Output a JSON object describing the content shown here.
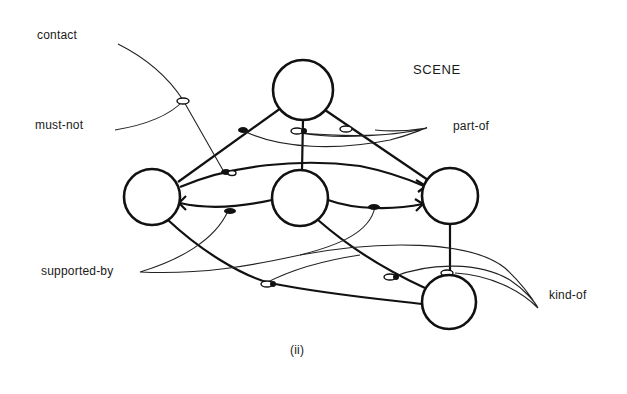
{
  "diagram": {
    "title": "SCENE",
    "caption": "(ii)",
    "relation_labels": {
      "contact": "contact",
      "must_not": "must-not",
      "part_of": "part-of",
      "supported_by": "supported-by",
      "kind_of": "kind-of"
    },
    "nodes": [
      {
        "id": "top",
        "cx": 303,
        "cy": 90,
        "r": 30
      },
      {
        "id": "left",
        "cx": 152,
        "cy": 197,
        "r": 28
      },
      {
        "id": "middle",
        "cx": 300,
        "cy": 198,
        "r": 28
      },
      {
        "id": "right",
        "cx": 450,
        "cy": 196,
        "r": 28
      },
      {
        "id": "bottom",
        "cx": 449,
        "cy": 302,
        "r": 27
      }
    ],
    "colors": {
      "ink": "#111111",
      "background": "#ffffff"
    }
  }
}
